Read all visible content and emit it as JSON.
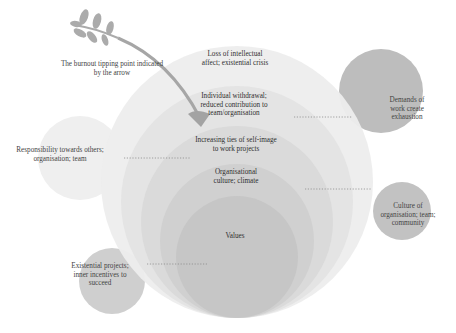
{
  "diagram": {
    "type": "nested-circles",
    "colors": {
      "background": "#ffffff",
      "ring1": "#eeeeee",
      "ring2": "#e6e6e6",
      "ring3": "#dddddd",
      "ring4": "#d3d3d3",
      "ring5": "#c8c8c8",
      "satellite_dark": "#bdbdbd",
      "satellite_light": "#ececec",
      "arrow": "#a9a9a9",
      "leaf": "#b0b0b0",
      "text": "#333333"
    },
    "arrow_label": "The burnout tipping point indicated by the arrow",
    "layers": [
      {
        "label": "Loss of intellectual affect; existential crisis"
      },
      {
        "label": "Individual withdrawal; reduced contribution to team/organisation"
      },
      {
        "label": "Increasing ties of self-image to work projects"
      },
      {
        "label": "Organisational culture; climate"
      },
      {
        "label": "Values"
      }
    ],
    "satellites": [
      {
        "label": "Demands of work create exhaustion"
      },
      {
        "label": "Responsibility towards others; organisation; team"
      },
      {
        "label": "Culture of organisation; team; community"
      },
      {
        "label": "Existential projects; inner incentives to succeed"
      }
    ]
  }
}
